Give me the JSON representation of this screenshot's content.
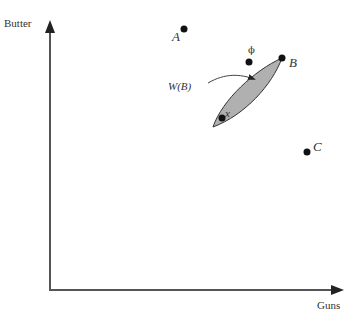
{
  "diagram": {
    "axes": {
      "y_label": "Butter",
      "x_label": "Guns",
      "color": "#555555"
    },
    "points": [
      {
        "id": "A",
        "label": "A"
      },
      {
        "id": "phi",
        "label": "ϕ"
      },
      {
        "id": "B",
        "label": "B"
      },
      {
        "id": "x",
        "label": "x"
      },
      {
        "id": "C",
        "label": "C"
      }
    ],
    "region": {
      "label": "W(B)",
      "fill": "#b0b0b0",
      "stroke": "#333333"
    },
    "point_color": "#111111"
  }
}
